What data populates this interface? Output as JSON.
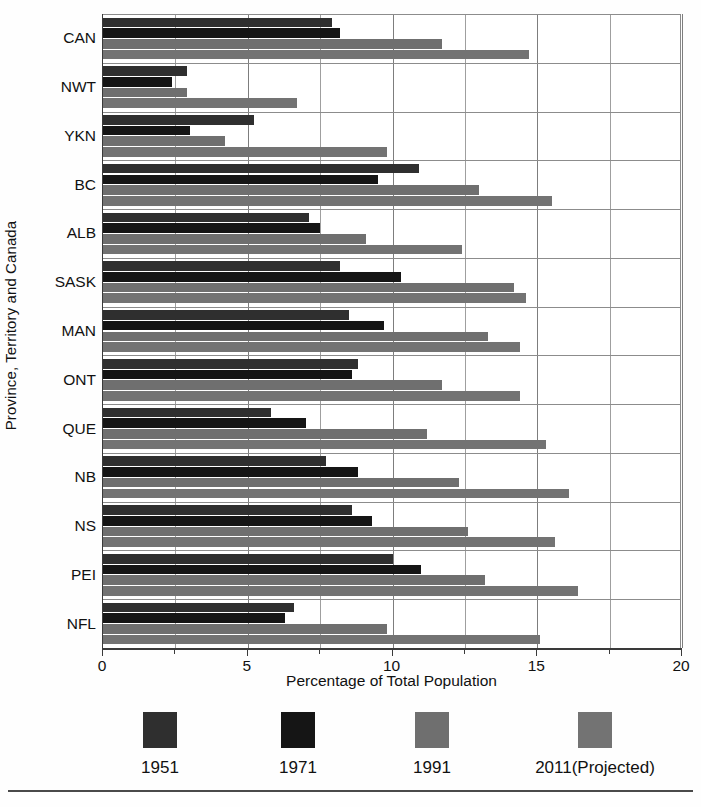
{
  "chart_data": {
    "type": "bar",
    "orientation": "horizontal",
    "title": "",
    "xlabel": "Percentage of Total Population",
    "ylabel": "Province, Territory and Canada",
    "xlim": [
      0,
      20
    ],
    "xticks": [
      0,
      5,
      10,
      15,
      20
    ],
    "xtick_labels": [
      "0",
      "5",
      "10",
      "15",
      "20"
    ],
    "minor_tick_interval": 2.5,
    "grid": "vertical and horizontal",
    "legend_position": "bottom",
    "categories": [
      "CAN",
      "NWT",
      "YKN",
      "BC",
      "ALB",
      "SASK",
      "MAN",
      "ONT",
      "QUE",
      "NB",
      "NS",
      "PEI",
      "NFL"
    ],
    "series": [
      {
        "name": "1951",
        "color": "#2f2f2f",
        "values": [
          7.9,
          2.9,
          5.2,
          10.9,
          7.1,
          8.2,
          8.5,
          8.8,
          5.8,
          7.7,
          8.6,
          10.0,
          6.6
        ]
      },
      {
        "name": "1971",
        "color": "#151515",
        "values": [
          8.2,
          2.4,
          3.0,
          9.5,
          7.5,
          10.3,
          9.7,
          8.6,
          7.0,
          8.8,
          9.3,
          11.0,
          6.3
        ]
      },
      {
        "name": "1991",
        "color": "#6f6f6f",
        "values": [
          11.7,
          2.9,
          4.2,
          13.0,
          9.1,
          14.2,
          13.3,
          11.7,
          11.2,
          12.3,
          12.6,
          13.2,
          9.8
        ]
      },
      {
        "name": "2011(Projected)",
        "color": "#737373",
        "values": [
          14.7,
          6.7,
          9.8,
          15.5,
          12.4,
          14.6,
          14.4,
          14.4,
          15.3,
          16.1,
          15.6,
          16.4,
          15.1
        ]
      }
    ]
  },
  "legend": {
    "entries": [
      {
        "label": "1951",
        "color": "#2f2f2f"
      },
      {
        "label": "1971",
        "color": "#151515"
      },
      {
        "label": "1991",
        "color": "#6f6f6f"
      },
      {
        "label": "2011(Projected)",
        "color": "#737373"
      }
    ]
  },
  "footer": {
    "caption": ""
  }
}
